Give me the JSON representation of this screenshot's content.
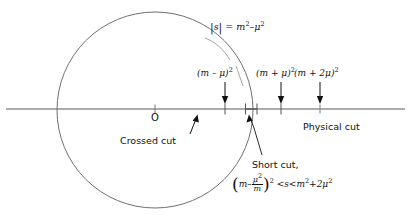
{
  "figure": {
    "type": "complex-s-plane-cut-diagram",
    "background": "#ffffff",
    "line_color": "#8c8c8c",
    "ink_color": "#111111",
    "origin_label": "O",
    "title_formula": {
      "abs_open": "|",
      "s_symbol": "s",
      "abs_close": "|",
      "equals": "=",
      "m": "m",
      "m_exp": "2",
      "minus": "–",
      "mu": "μ",
      "mu_exp": "2",
      "plain": "|s| = m² – μ²"
    },
    "axis": {
      "y": 109,
      "x_start": 6,
      "x_end": 405,
      "origin_x": 155,
      "tick_origin": "O"
    },
    "circle": {
      "center_x": 155,
      "center_y": 110,
      "radius": 98,
      "stroke": "#6f6f6f"
    },
    "point_labels": [
      {
        "text_plain": "(m – μ)²",
        "base": "(m – μ)",
        "exp": "2",
        "x": 225,
        "label_x": 197,
        "label_y": 69
      },
      {
        "text_plain": "(m + μ)²",
        "base": "(m + μ)",
        "exp": "2",
        "x": 281,
        "label_x": 256,
        "label_y": 69
      },
      {
        "text_plain": "(m + 2μ)²",
        "base": "(m + 2μ)",
        "exp": "2",
        "x": 320,
        "label_x": 292,
        "label_y": 69
      }
    ],
    "annotations": {
      "crossed_cut": {
        "label": "Crossed cut",
        "x": 120,
        "y": 136
      },
      "physical_cut": {
        "label": "Physical cut",
        "x": 305,
        "y": 122
      },
      "short_cut": {
        "label": "Short cut,",
        "x": 252,
        "y": 160,
        "inequality_plain": "(m – μ²/m)² < s < m² + 2μ²",
        "parts": {
          "m": "m",
          "minus": "–",
          "frac_num": "μ",
          "frac_num_exp": "2",
          "frac_den": "m",
          "outer_exp": "2",
          "lt1": "<",
          "s": "s",
          "lt2": "<",
          "m2": "m",
          "m2_exp": "2",
          "plus": "+",
          "two_mu": "2μ",
          "two_mu_exp": "2"
        }
      }
    }
  }
}
